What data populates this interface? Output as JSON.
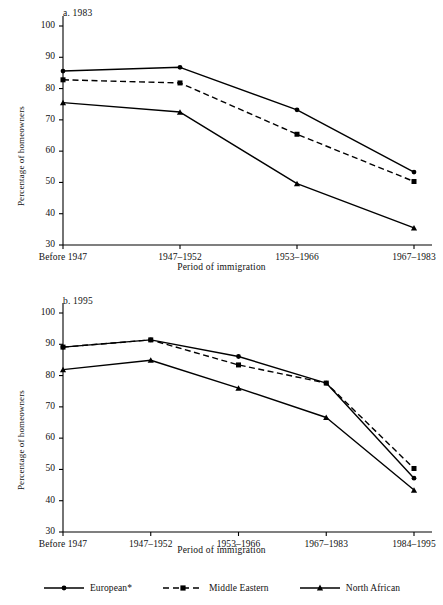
{
  "figure": {
    "panels": [
      {
        "id": "a",
        "title": "a. 1983",
        "xlabel": "Period of immigration",
        "ylabel": "Percentage of homeowners"
      },
      {
        "id": "b",
        "title": "b. 1995",
        "xlabel": "Period of immigration",
        "ylabel": "Percentage of homeowners"
      }
    ],
    "legend": [
      {
        "label": "European*",
        "style": "solid",
        "marker": "circle",
        "color": "#000000"
      },
      {
        "label": "Middle Eastern",
        "style": "dashed",
        "marker": "square",
        "color": "#000000"
      },
      {
        "label": "North African",
        "style": "solid",
        "marker": "triangle",
        "color": "#000000"
      }
    ]
  },
  "chart_data": [
    {
      "type": "line",
      "title": "a. 1983",
      "xlabel": "Period of immigration",
      "ylabel": "Percentage of homeowners",
      "categories": [
        "Before 1947",
        "1947–1952",
        "1953–1966",
        "1967–1983"
      ],
      "ylim": [
        30,
        100
      ],
      "yticks": [
        30,
        40,
        50,
        60,
        70,
        80,
        90,
        100
      ],
      "grid": false,
      "legend_position": "bottom",
      "series": [
        {
          "name": "European*",
          "style": "solid",
          "marker": "circle",
          "values": [
            85.6,
            86.8,
            73.2,
            53.3
          ]
        },
        {
          "name": "Middle Eastern",
          "style": "dashed",
          "marker": "square",
          "values": [
            82.8,
            81.8,
            65.4,
            50.3
          ]
        },
        {
          "name": "North African",
          "style": "solid",
          "marker": "triangle",
          "values": [
            75.5,
            72.5,
            49.6,
            35.5
          ]
        }
      ]
    },
    {
      "type": "line",
      "title": "b. 1995",
      "xlabel": "Period of immigration",
      "ylabel": "Percentage of homeowners",
      "categories": [
        "Before 1947",
        "1947–1952",
        "1953–1966",
        "1967–1983",
        "1984–1995"
      ],
      "ylim": [
        30,
        100
      ],
      "yticks": [
        30,
        40,
        50,
        60,
        70,
        80,
        90,
        100
      ],
      "grid": false,
      "legend_position": "bottom",
      "series": [
        {
          "name": "European*",
          "style": "solid",
          "marker": "circle",
          "values": [
            89.1,
            91.4,
            86.1,
            77.6,
            47.2
          ]
        },
        {
          "name": "Middle Eastern",
          "style": "dashed",
          "marker": "square",
          "values": [
            89.1,
            91.4,
            83.4,
            77.6,
            50.3
          ]
        },
        {
          "name": "North African",
          "style": "solid",
          "marker": "triangle",
          "values": [
            81.9,
            84.9,
            76.0,
            66.6,
            43.4
          ]
        }
      ]
    }
  ]
}
